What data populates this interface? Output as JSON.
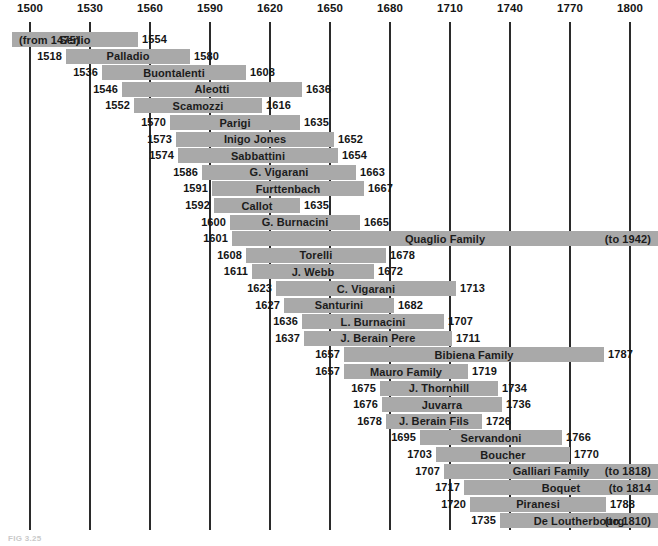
{
  "figure": {
    "caption": "FIG 3.25",
    "bar_color": "#a9a9a9",
    "gridline_color": "#2b2b2b",
    "text_color": "#141414",
    "background": "#ffffff"
  },
  "chart_data": {
    "type": "bar",
    "title": "",
    "subtitle": "",
    "xlabel": "",
    "ylabel": "",
    "orientation": "horizontal",
    "grid": true,
    "legend": "none",
    "xlim": [
      1500,
      1800
    ],
    "axis_ticks": [
      1500,
      1530,
      1560,
      1590,
      1620,
      1650,
      1680,
      1710,
      1740,
      1770,
      1800
    ],
    "tick_labels": [
      "1500",
      "1530",
      "1560",
      "1590",
      "1620",
      "1650",
      "1680",
      "1710",
      "1740",
      "1770",
      "1800"
    ],
    "categories": [
      "Serlio",
      "Palladio",
      "Buontalenti",
      "Aleotti",
      "Scamozzi",
      "Parigi",
      "Inigo Jones",
      "Sabbattini",
      "G. Vigarani",
      "Furttenbach",
      "Callot",
      "G. Burnacini",
      "Quaglio Family",
      "Torelli",
      "J. Webb",
      "C. Vigarani",
      "Santurini",
      "L. Burnacini",
      "J. Berain Pere",
      "Bibiena Family",
      "Mauro Family",
      "J. Thornhill",
      "Juvarra",
      "J. Berain Fils",
      "Servandoni",
      "Boucher",
      "Galliari Family",
      "Boquet",
      "Piranesi",
      "De Loutherbourg"
    ],
    "bars": [
      {
        "name": "Serlio",
        "start": 1500,
        "end": 1554,
        "start_label": "(from 1475)",
        "start_label_inside": true,
        "end_label": "1554",
        "end_label_inside": false,
        "clipped_left": true
      },
      {
        "name": "Palladio",
        "start": 1518,
        "end": 1580,
        "start_label": "1518",
        "start_label_inside": false,
        "end_label": "1580",
        "end_label_inside": false
      },
      {
        "name": "Buontalenti",
        "start": 1536,
        "end": 1608,
        "start_label": "1536",
        "start_label_inside": false,
        "end_label": "1608",
        "end_label_inside": false
      },
      {
        "name": "Aleotti",
        "start": 1546,
        "end": 1636,
        "start_label": "1546",
        "start_label_inside": false,
        "end_label": "1636",
        "end_label_inside": false
      },
      {
        "name": "Scamozzi",
        "start": 1552,
        "end": 1616,
        "start_label": "1552",
        "start_label_inside": false,
        "end_label": "1616",
        "end_label_inside": false
      },
      {
        "name": "Parigi",
        "start": 1570,
        "end": 1635,
        "start_label": "1570",
        "start_label_inside": false,
        "end_label": "1635",
        "end_label_inside": false
      },
      {
        "name": "Inigo Jones",
        "start": 1573,
        "end": 1652,
        "start_label": "1573",
        "start_label_inside": false,
        "end_label": "1652",
        "end_label_inside": false
      },
      {
        "name": "Sabbattini",
        "start": 1574,
        "end": 1654,
        "start_label": "1574",
        "start_label_inside": false,
        "end_label": "1654",
        "end_label_inside": false
      },
      {
        "name": "G. Vigarani",
        "start": 1586,
        "end": 1663,
        "start_label": "1586",
        "start_label_inside": false,
        "end_label": "1663",
        "end_label_inside": false
      },
      {
        "name": "Furttenbach",
        "start": 1591,
        "end": 1667,
        "start_label": "1591",
        "start_label_inside": false,
        "end_label": "1667",
        "end_label_inside": false
      },
      {
        "name": "Callot",
        "start": 1592,
        "end": 1635,
        "start_label": "1592",
        "start_label_inside": false,
        "end_label": "1635",
        "end_label_inside": false
      },
      {
        "name": "G. Burnacini",
        "start": 1600,
        "end": 1665,
        "start_label": "1600",
        "start_label_inside": false,
        "end_label": "1665",
        "end_label_inside": false
      },
      {
        "name": "Quaglio Family",
        "start": 1601,
        "end": 1804,
        "start_label": "1601",
        "start_label_inside": false,
        "end_label": "(to 1942)",
        "end_label_inside": true,
        "clipped_right": true
      },
      {
        "name": "Torelli",
        "start": 1608,
        "end": 1678,
        "start_label": "1608",
        "start_label_inside": false,
        "end_label": "1678",
        "end_label_inside": false
      },
      {
        "name": "J. Webb",
        "start": 1611,
        "end": 1672,
        "start_label": "1611",
        "start_label_inside": false,
        "end_label": "1672",
        "end_label_inside": false
      },
      {
        "name": "C. Vigarani",
        "start": 1623,
        "end": 1713,
        "start_label": "1623",
        "start_label_inside": false,
        "end_label": "1713",
        "end_label_inside": false
      },
      {
        "name": "Santurini",
        "start": 1627,
        "end": 1682,
        "start_label": "1627",
        "start_label_inside": false,
        "end_label": "1682",
        "end_label_inside": false
      },
      {
        "name": "L. Burnacini",
        "start": 1636,
        "end": 1707,
        "start_label": "1636",
        "start_label_inside": false,
        "end_label": "1707",
        "end_label_inside": false
      },
      {
        "name": "J. Berain Pere",
        "start": 1637,
        "end": 1711,
        "start_label": "1637",
        "start_label_inside": false,
        "end_label": "1711",
        "end_label_inside": false
      },
      {
        "name": "Bibiena Family",
        "start": 1657,
        "end": 1787,
        "start_label": "1657",
        "start_label_inside": false,
        "end_label": "1787",
        "end_label_inside": false
      },
      {
        "name": "Mauro Family",
        "start": 1657,
        "end": 1719,
        "start_label": "1657",
        "start_label_inside": false,
        "end_label": "1719",
        "end_label_inside": false
      },
      {
        "name": "J. Thornhill",
        "start": 1675,
        "end": 1734,
        "start_label": "1675",
        "start_label_inside": false,
        "end_label": "1734",
        "end_label_inside": false
      },
      {
        "name": "Juvarra",
        "start": 1676,
        "end": 1736,
        "start_label": "1676",
        "start_label_inside": false,
        "end_label": "1736",
        "end_label_inside": false
      },
      {
        "name": "J. Berain Fils",
        "start": 1678,
        "end": 1726,
        "start_label": "1678",
        "start_label_inside": false,
        "end_label": "1726",
        "end_label_inside": false
      },
      {
        "name": "Servandoni",
        "start": 1695,
        "end": 1766,
        "start_label": "1695",
        "start_label_inside": false,
        "end_label": "1766",
        "end_label_inside": false
      },
      {
        "name": "Boucher",
        "start": 1703,
        "end": 1770,
        "start_label": "1703",
        "start_label_inside": false,
        "end_label": "1770",
        "end_label_inside": false
      },
      {
        "name": "Galliari Family",
        "start": 1707,
        "end": 1804,
        "start_label": "1707",
        "start_label_inside": false,
        "end_label": "(to 1818)",
        "end_label_inside": true,
        "clipped_right": true
      },
      {
        "name": "Boquet",
        "start": 1717,
        "end": 1804,
        "start_label": "1717",
        "start_label_inside": false,
        "end_label": "(to 1814",
        "end_label_inside": true,
        "clipped_right": true
      },
      {
        "name": "Piranesi",
        "start": 1720,
        "end": 1788,
        "start_label": "1720",
        "start_label_inside": false,
        "end_label": "1788",
        "end_label_inside": false
      },
      {
        "name": "De Loutherbourg",
        "start": 1735,
        "end": 1804,
        "start_label": "1735",
        "start_label_inside": false,
        "end_label": "(to 1810)",
        "end_label_inside": true,
        "clipped_right": true
      }
    ]
  }
}
